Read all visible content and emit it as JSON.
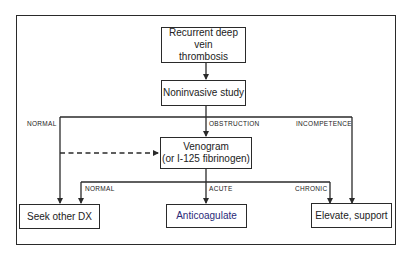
{
  "diagram": {
    "nodes": {
      "start": {
        "line1": "Recurrent deep vein",
        "line2": "thrombosis"
      },
      "study": {
        "label": "Noninvasive study"
      },
      "venogram": {
        "line1": "Venogram",
        "line2": "(or I-125 fibrinogen)"
      },
      "seek": {
        "label": "Seek other DX"
      },
      "anticoag": {
        "label": "Anticoagulate"
      },
      "elevate": {
        "label": "Elevate, support"
      }
    },
    "edge_labels": {
      "study_normal": "NORMAL",
      "study_obstruction": "OBSTRUCTION",
      "study_incompetence": "INCOMPETENCE",
      "veno_normal": "NORMAL",
      "veno_acute": "ACUTE",
      "veno_chronic": "CHRONIC"
    },
    "colors": {
      "line": "#2a2a2a",
      "anticoagulate_text": "#2a2a78"
    }
  }
}
